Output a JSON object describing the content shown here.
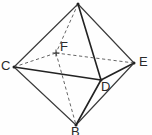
{
  "figure": {
    "background_color": "#fefefe",
    "line_color": "#3a3a3a",
    "hidden_line_color": "#666666",
    "label_color": "#2a2a2a",
    "width": 152,
    "height": 135,
    "labels": [
      {
        "id": "C",
        "text": "C",
        "x": 1,
        "y": 59
      },
      {
        "id": "E",
        "text": "E",
        "x": 139,
        "y": 55
      },
      {
        "id": "F",
        "text": "F",
        "x": 60,
        "y": 40
      },
      {
        "id": "D",
        "text": "D",
        "x": 101,
        "y": 80
      },
      {
        "id": "B",
        "text": "B",
        "x": 71,
        "y": 125
      }
    ],
    "vertices": [
      {
        "id": "A",
        "label": "",
        "x": 78,
        "y": 4,
        "hidden": false,
        "marker": "dot"
      },
      {
        "id": "C",
        "label": "C",
        "x": 14,
        "y": 67,
        "hidden": false,
        "marker": "dot"
      },
      {
        "id": "E",
        "label": "E",
        "x": 134,
        "y": 63,
        "hidden": false,
        "marker": "dot"
      },
      {
        "id": "F",
        "label": "F",
        "x": 56,
        "y": 53,
        "hidden": true,
        "marker": "tick"
      },
      {
        "id": "D",
        "label": "D",
        "x": 101,
        "y": 80,
        "hidden": false,
        "marker": "dot"
      },
      {
        "id": "B",
        "label": "B",
        "x": 76,
        "y": 125,
        "hidden": false,
        "marker": "dot"
      }
    ],
    "edges": [
      {
        "from": "A",
        "to": "C",
        "style": "solid"
      },
      {
        "from": "A",
        "to": "E",
        "style": "solid"
      },
      {
        "from": "A",
        "to": "D",
        "style": "solid-strong"
      },
      {
        "from": "A",
        "to": "F",
        "style": "dashed"
      },
      {
        "from": "C",
        "to": "D",
        "style": "solid-strong"
      },
      {
        "from": "D",
        "to": "E",
        "style": "solid-strong"
      },
      {
        "from": "C",
        "to": "F",
        "style": "dashed"
      },
      {
        "from": "F",
        "to": "E",
        "style": "dashed"
      },
      {
        "from": "C",
        "to": "B",
        "style": "solid"
      },
      {
        "from": "E",
        "to": "B",
        "style": "solid"
      },
      {
        "from": "D",
        "to": "B",
        "style": "solid-strong"
      },
      {
        "from": "F",
        "to": "B",
        "style": "dashed"
      }
    ]
  }
}
